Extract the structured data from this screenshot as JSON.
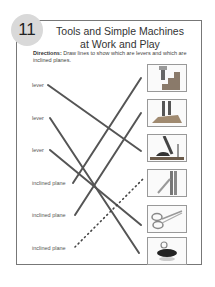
{
  "activity": {
    "number": "11",
    "title_line1": "Tools and Simple Machines",
    "title_line2": "at Work and Play",
    "directions_label": "Directions:",
    "directions_text": " Draw lines to show which are levers and which are inclined planes."
  },
  "labels": [
    {
      "text": "lever"
    },
    {
      "text": "lever"
    },
    {
      "text": "lever"
    },
    {
      "text": "inclined plane"
    },
    {
      "text": "inclined plane"
    },
    {
      "text": "inclined plane"
    }
  ],
  "pictures": [
    {
      "icon": "stairs-icon",
      "desc": "person climbing stairs"
    },
    {
      "icon": "ramp-icon",
      "desc": "feet on ramp"
    },
    {
      "icon": "hammer-icon",
      "desc": "claw hammer pulling nail"
    },
    {
      "icon": "zipper-icon",
      "desc": "zipper"
    },
    {
      "icon": "scissors-icon",
      "desc": "scissors"
    },
    {
      "icon": "bottle-opener-icon",
      "desc": "bottle cap opener"
    }
  ],
  "connections": [
    {
      "from": 0,
      "to": 2,
      "style": "solid"
    },
    {
      "from": 1,
      "to": 5,
      "style": "solid"
    },
    {
      "from": 2,
      "to": 4,
      "style": "solid"
    },
    {
      "from": 3,
      "to": 0,
      "style": "solid"
    },
    {
      "from": 4,
      "to": 1,
      "style": "solid"
    },
    {
      "from": 5,
      "to": 3,
      "style": "dotted"
    }
  ]
}
